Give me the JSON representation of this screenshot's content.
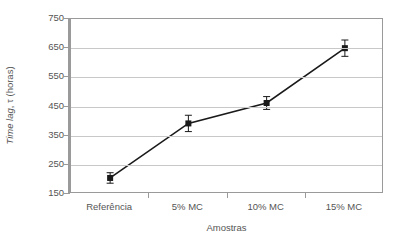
{
  "chart_data": {
    "type": "line",
    "title": "",
    "subtitle": "",
    "xlabel": "Amostras",
    "ylabel": "Time lag, τ (horas)",
    "ylabel_italic_part": "Time lag",
    "ylabel_rest": ", τ (horas)",
    "categories": [
      "Referência",
      "5% MC",
      "10% MC",
      "15% MC"
    ],
    "values": [
      205,
      392,
      462,
      650
    ],
    "error_bars": [
      18,
      28,
      22,
      28
    ],
    "ytick_labels": [
      "750",
      "650",
      "550",
      "450",
      "350",
      "250",
      "150"
    ],
    "ytick_values": [
      750,
      650,
      550,
      450,
      350,
      250,
      150
    ],
    "ylim": [
      150,
      750
    ],
    "grid": true,
    "grid_axis": "y",
    "legend": false,
    "legend_position": "none",
    "marker": "square",
    "marker_color": "#1a1a1a",
    "line_color": "#1a1a1a",
    "gridline_color": "#c8c8c8",
    "axis_color": "#9a9a9a",
    "text_color": "#555555",
    "series": [
      {
        "name": "Time lag",
        "values": [
          205,
          392,
          462,
          650
        ],
        "errors": [
          18,
          28,
          22,
          28
        ]
      }
    ]
  }
}
